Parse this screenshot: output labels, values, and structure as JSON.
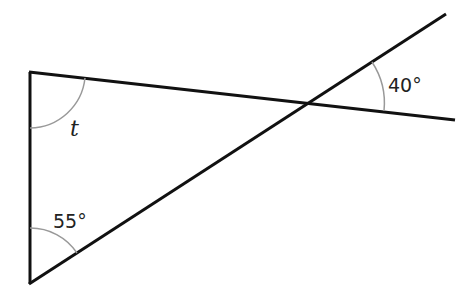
{
  "diagram": {
    "type": "geometry-angles",
    "labels": {
      "unknown_angle": "t",
      "bottom_angle": "55°",
      "right_angle": "40°"
    },
    "colors": {
      "line": "#111111",
      "arc": "#999999",
      "background": "#ffffff"
    }
  }
}
